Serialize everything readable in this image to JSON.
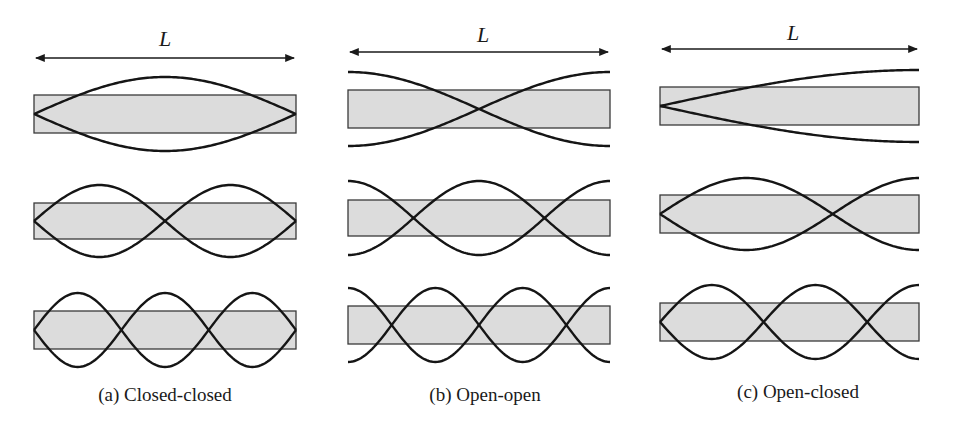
{
  "figure": {
    "length_symbol": "L",
    "panels": [
      {
        "id": "a",
        "caption": "(a) Closed-closed",
        "boundary": "closed-closed",
        "x0": 34,
        "x1": 296,
        "label_x": 165,
        "label_y": 46,
        "arrow_y": 58,
        "modes": [
          {
            "harmonic": 1,
            "cy": 114,
            "amp": 37,
            "half_rod": 19
          },
          {
            "harmonic": 2,
            "cy": 221,
            "amp": 36,
            "half_rod": 18
          },
          {
            "harmonic": 3,
            "cy": 330,
            "amp": 37,
            "half_rod": 19
          }
        ],
        "caption_x": 165,
        "caption_y": 401
      },
      {
        "id": "b",
        "caption": "(b) Open-open",
        "boundary": "open-open",
        "x0": 348,
        "x1": 610,
        "label_x": 483,
        "label_y": 42,
        "arrow_y": 52,
        "modes": [
          {
            "harmonic": 1,
            "cy": 109,
            "amp": 37,
            "half_rod": 19
          },
          {
            "harmonic": 2,
            "cy": 218,
            "amp": 37,
            "half_rod": 18
          },
          {
            "harmonic": 3,
            "cy": 325,
            "amp": 37,
            "half_rod": 19
          }
        ],
        "caption_x": 485,
        "caption_y": 401
      },
      {
        "id": "c",
        "caption": "(c) Open-closed",
        "boundary": "open-closed",
        "x0": 660,
        "x1": 919,
        "label_x": 793,
        "label_y": 40,
        "arrow_y": 49,
        "modes": [
          {
            "harmonic": 1,
            "cy": 106,
            "amp": 36,
            "half_rod": 19
          },
          {
            "harmonic": 3,
            "cy": 214,
            "amp": 36,
            "half_rod": 19
          },
          {
            "harmonic": 5,
            "cy": 322,
            "amp": 37,
            "half_rod": 19
          }
        ],
        "caption_x": 798,
        "caption_y": 398
      }
    ]
  },
  "colors": {
    "rod_fill": "#dcdcdc",
    "rod_stroke": "#3a3a3a",
    "wave_stroke": "#151515",
    "background": "#ffffff"
  }
}
